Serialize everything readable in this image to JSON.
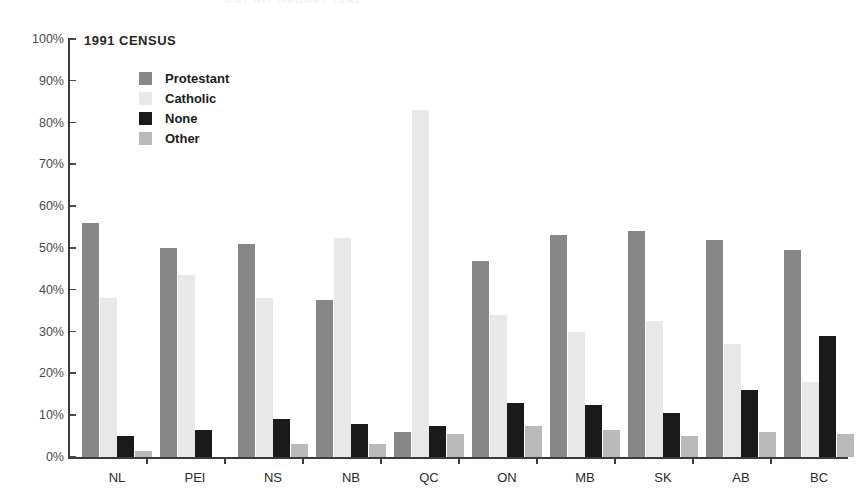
{
  "top_crop_ghost": "cut off header text",
  "chart_title": "1991 CENSUS",
  "legend": {
    "items": [
      {
        "label": "Protestant",
        "color": "#878787"
      },
      {
        "label": "Catholic",
        "color": "#e8e8e8"
      },
      {
        "label": "None",
        "color": "#1a1a1a"
      },
      {
        "label": "Other",
        "color": "#b9b9b9"
      }
    ]
  },
  "axis": {
    "y_ticks": [
      "0%",
      "10%",
      "20%",
      "30%",
      "40%",
      "50%",
      "60%",
      "70%",
      "80%",
      "90%",
      "100%"
    ]
  },
  "chart_data": {
    "type": "bar",
    "title": "1991 CENSUS",
    "xlabel": "",
    "ylabel": "",
    "ylim": [
      0,
      100
    ],
    "grid": false,
    "legend_position": "inside-top-left",
    "y_tick_labels": [
      "0%",
      "10%",
      "20%",
      "30%",
      "40%",
      "50%",
      "60%",
      "70%",
      "80%",
      "90%",
      "100%"
    ],
    "y_tick_values": [
      0,
      10,
      20,
      30,
      40,
      50,
      60,
      70,
      80,
      90,
      100
    ],
    "categories": [
      "NL",
      "PEI",
      "NS",
      "NB",
      "QC",
      "ON",
      "MB",
      "SK",
      "AB",
      "BC"
    ],
    "series": [
      {
        "name": "Protestant",
        "color": "#878787",
        "values": [
          56,
          50,
          51,
          37.5,
          6,
          47,
          53,
          54,
          52,
          49.5
        ]
      },
      {
        "name": "Catholic",
        "color": "#e8e8e8",
        "values": [
          38,
          43.5,
          38,
          52.5,
          83,
          34,
          30,
          32.5,
          27,
          18
        ]
      },
      {
        "name": "None",
        "color": "#1a1a1a",
        "values": [
          5,
          6.5,
          9,
          8,
          7.5,
          13,
          12.5,
          10.5,
          16,
          29
        ]
      },
      {
        "name": "Other",
        "color": "#b9b9b9",
        "values": [
          1.5,
          0,
          3,
          3,
          5.5,
          7.5,
          6.5,
          5,
          6,
          5.5
        ]
      }
    ]
  }
}
